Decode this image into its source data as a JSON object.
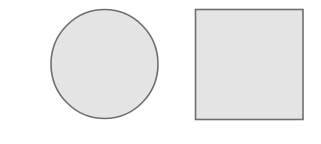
{
  "canvas": {
    "width": 321,
    "height": 144,
    "background": "#ffffff"
  },
  "shapes": [
    {
      "type": "circle",
      "name": "circle",
      "cx": 104.5,
      "cy": 64,
      "rx": 53.5,
      "ry": 54.5,
      "fill": "#e4e4e4",
      "stroke": "#6e6e6e",
      "stroke_width": 1.6
    },
    {
      "type": "rect",
      "name": "square",
      "x": 195.5,
      "y": 9.5,
      "width": 107.5,
      "height": 110,
      "fill": "#e4e4e4",
      "stroke": "#6e6e6e",
      "stroke_width": 1.6
    }
  ]
}
